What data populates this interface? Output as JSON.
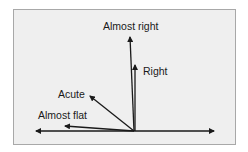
{
  "diagram": {
    "labels": {
      "almost_right": "Almost right",
      "right": "Right",
      "acute": "Acute",
      "almost_flat": "Almost flat"
    },
    "colors": {
      "background": "#efefef",
      "border": "#a8a8a8",
      "line": "#1a1a1a"
    }
  }
}
